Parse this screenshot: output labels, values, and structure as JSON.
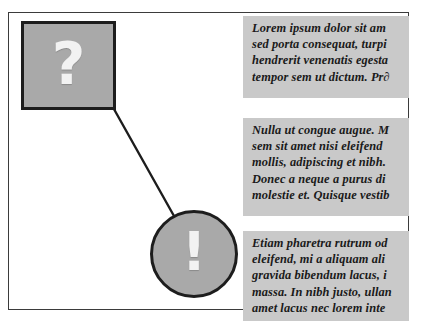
{
  "diagram": {
    "frame": {
      "name": "page-frame"
    },
    "colors": {
      "panel_gray": "#a9a9a9",
      "text_block_gray": "#c9c9c9",
      "stroke_dark": "#1d1d1d",
      "frame_border": "#3b3b3b",
      "glyph_white": "#f2f2f2",
      "body_text": "#1a1a1a"
    },
    "question_box": {
      "icon_name": "question-mark-icon",
      "glyph": "?"
    },
    "exclaim_circle": {
      "icon_name": "exclamation-mark-icon",
      "glyph": "!"
    },
    "connector": {
      "name": "leader-line",
      "from_x": 110,
      "from_y": 102,
      "to_x": 174,
      "to_y": 216
    },
    "text_blocks": [
      {
        "id": "text-block-0",
        "lines": [
          "Lorem ipsum dolor sit am",
          "sed porta consequat, turpi",
          "hendrerit venenatis egesta",
          "tempor sem ut dictum. Pr∂"
        ]
      },
      {
        "id": "text-block-1",
        "lines": [
          "Nulla ut congue augue. M",
          "sem sit amet nisi eleifend",
          "mollis, adipiscing et nibh.",
          "Donec a neque a purus di",
          "molestie et. Quisque vestib"
        ]
      },
      {
        "id": "text-block-2",
        "lines": [
          "Etiam pharetra rutrum od",
          "eleifend, mi a aliquam ali",
          "gravida bibendum lacus, i",
          "massa. In nibh justo, ullan",
          "amet lacus nec lorem inte"
        ]
      }
    ]
  }
}
